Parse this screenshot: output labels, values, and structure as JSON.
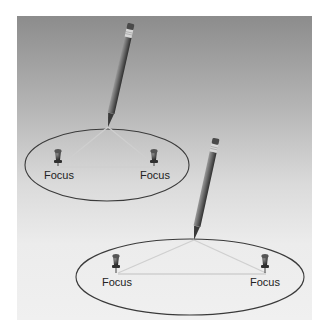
{
  "figure": {
    "diagrams": [
      {
        "id": "narrow-foci-far",
        "foci_labels": [
          "Focus",
          "Focus"
        ],
        "ellipse": {
          "cx": 107,
          "cy": 165,
          "rx": 82,
          "ry": 36
        },
        "apex": {
          "x": 108,
          "y": 127
        },
        "pins": [
          {
            "x": 58,
            "y": 159
          },
          {
            "x": 154,
            "y": 159
          }
        ],
        "pencil": {
          "tip": [
            108,
            127
          ],
          "end": [
            131,
            24
          ]
        }
      },
      {
        "id": "wide-foci",
        "foci_labels": [
          "Focus",
          "Focus"
        ],
        "ellipse": {
          "cx": 190,
          "cy": 277,
          "rx": 114,
          "ry": 38
        },
        "apex": {
          "x": 194,
          "y": 240
        },
        "pins": [
          {
            "x": 116,
            "y": 264
          },
          {
            "x": 265,
            "y": 264
          }
        ],
        "pencil": {
          "tip": [
            194,
            240
          ],
          "end": [
            216,
            139
          ]
        }
      }
    ],
    "colors": {
      "background_top": "#8c8c8c",
      "background_bottom": "#f0f0f0",
      "ellipse_stroke": "#3a3a3a",
      "string": "#c9c9c9",
      "pencil_body": "#6e6e6e",
      "pin": "#3d3d3d"
    }
  }
}
